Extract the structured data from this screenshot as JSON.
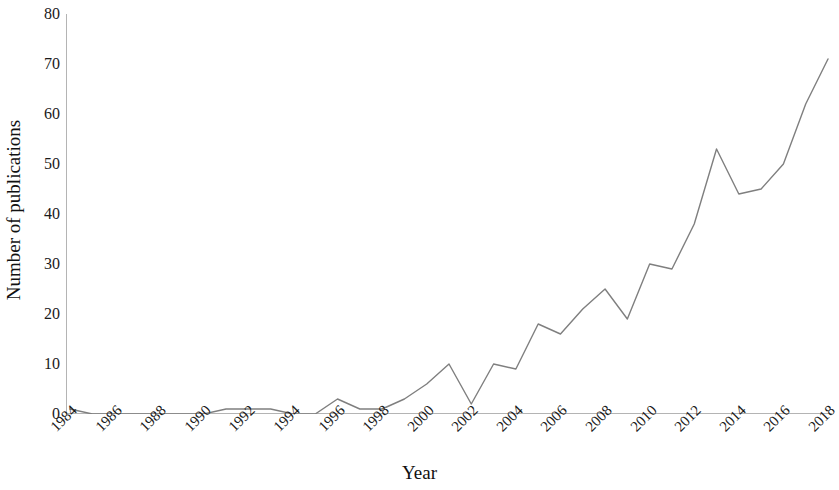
{
  "chart_data": {
    "type": "line",
    "title": "",
    "xlabel": "Year",
    "ylabel": "Number of publications",
    "xlim": [
      1984,
      2018
    ],
    "ylim": [
      0,
      80
    ],
    "grid": false,
    "legend": null,
    "line_color": "#7f7f7f",
    "x": [
      1984,
      1985,
      1986,
      1987,
      1988,
      1989,
      1990,
      1991,
      1992,
      1993,
      1994,
      1995,
      1996,
      1997,
      1998,
      1999,
      2000,
      2001,
      2002,
      2003,
      2004,
      2005,
      2006,
      2007,
      2008,
      2009,
      2010,
      2011,
      2012,
      2013,
      2014,
      2015,
      2016,
      2017,
      2018
    ],
    "values": [
      1,
      0,
      0,
      0,
      0,
      0,
      0,
      1,
      1,
      1,
      0,
      0,
      3,
      1,
      1,
      3,
      6,
      10,
      2,
      10,
      9,
      18,
      16,
      21,
      25,
      19,
      30,
      29,
      38,
      53,
      44,
      45,
      50,
      62,
      71
    ],
    "series": [
      {
        "name": "Number of publications",
        "values": [
          1,
          0,
          0,
          0,
          0,
          0,
          0,
          1,
          1,
          1,
          0,
          0,
          3,
          1,
          1,
          3,
          6,
          10,
          2,
          10,
          9,
          18,
          16,
          21,
          25,
          19,
          30,
          29,
          38,
          53,
          44,
          45,
          50,
          62,
          71
        ]
      }
    ],
    "y_ticks": [
      0,
      10,
      20,
      30,
      40,
      50,
      60,
      70,
      80
    ],
    "y_tick_labels": [
      "0",
      "10",
      "20",
      "30",
      "40",
      "50",
      "60",
      "70",
      "80"
    ],
    "x_ticks": [
      1984,
      1986,
      1988,
      1990,
      1992,
      1994,
      1996,
      1998,
      2000,
      2002,
      2004,
      2006,
      2008,
      2010,
      2012,
      2014,
      2016,
      2018
    ],
    "x_tick_labels": [
      "1984",
      "1986",
      "1988",
      "1990",
      "1992",
      "1994",
      "1996",
      "1998",
      "2000",
      "2002",
      "2004",
      "2006",
      "2008",
      "2010",
      "2012",
      "2014",
      "2016",
      "2018"
    ]
  },
  "axis_colors": {
    "axis_line": "#b4b4b4",
    "text": "#1a1a1a"
  }
}
